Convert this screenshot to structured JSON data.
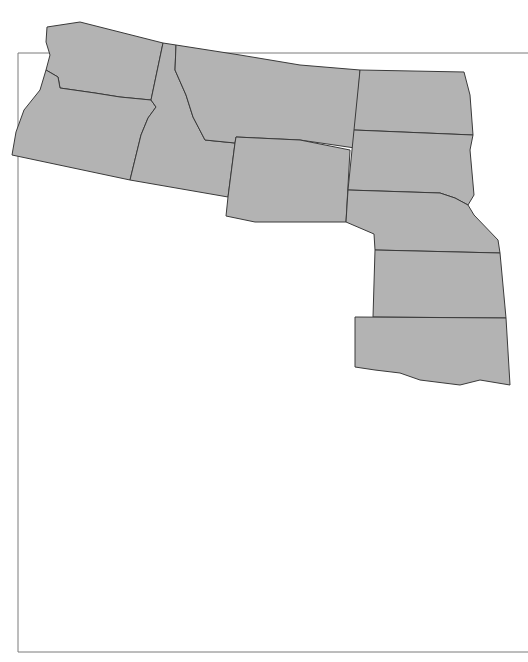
{
  "map": {
    "title": "",
    "region": "Western United States with Alaska and Hawaii insets",
    "colors": {
      "land": "#b3b3b3",
      "border": "#3a3a3a",
      "marker": "#111111",
      "marker_text": "#ffffff",
      "background": "#ffffff"
    },
    "markers": [
      {
        "id": "m1",
        "label": "1",
        "x": 342,
        "y": 158
      },
      {
        "id": "m7",
        "label": "7",
        "x": 364,
        "y": 178
      },
      {
        "id": "m9",
        "label": "9",
        "x": 65,
        "y": 74
      },
      {
        "id": "m5",
        "label": "5",
        "x": 62,
        "y": 152
      },
      {
        "id": "m6",
        "label": "6",
        "x": 196,
        "y": 164
      },
      {
        "id": "m24",
        "label": "24",
        "x": 15,
        "y": 238
      },
      {
        "id": "m26",
        "label": "26",
        "x": 163,
        "y": 284
      },
      {
        "id": "m2",
        "label": "2",
        "x": 176,
        "y": 285
      },
      {
        "id": "m14",
        "label": "14",
        "x": 238,
        "y": 281
      },
      {
        "id": "m23",
        "label": "23",
        "x": 204,
        "y": 300
      },
      {
        "id": "m28",
        "label": "28",
        "x": 323,
        "y": 291
      },
      {
        "id": "m12",
        "label": "12",
        "x": 237,
        "y": 316
      },
      {
        "id": "m13",
        "label": "13",
        "x": 240,
        "y": 328
      },
      {
        "id": "m17",
        "label": "17",
        "x": 326,
        "y": 441
      },
      {
        "id": "m29",
        "label": "29",
        "x": 155,
        "y": 560
      },
      {
        "id": "m22",
        "label": "22",
        "x": 266,
        "y": 580
      }
    ]
  }
}
